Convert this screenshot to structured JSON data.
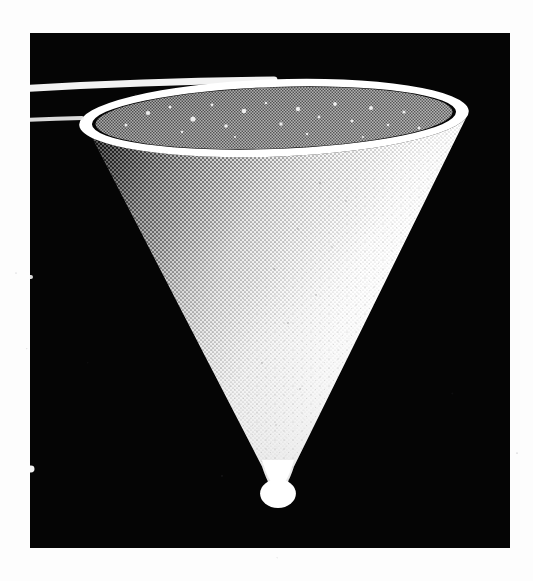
{
  "page": {
    "kind": "scanned-figure-page",
    "background_color": "#fdfdfd",
    "width": 533,
    "height": 581,
    "caption": "",
    "margin_note": ""
  },
  "figure_panel": {
    "name": "rendered-cone-figure",
    "background_color": "#050505",
    "x": 30,
    "y": 33,
    "width": 480,
    "height": 515,
    "border": "none"
  },
  "chart_data": {
    "type": "scatter",
    "title": "",
    "subtitle": "",
    "xlabel": "",
    "ylabel": "",
    "legend": [],
    "annotations": [],
    "grid": false,
    "render": {
      "subject": "cone",
      "orientation": "apex-down",
      "projection": "perspective",
      "shading": "diffuse-halftone-dither",
      "light_direction": "upper-right",
      "background": "#050505",
      "surface_color_lit": "#ffffff",
      "surface_color_shadow": "#1a1a1a",
      "interior_color": "#8c8c8c",
      "rim_highlight_color": "#ffffff"
    },
    "geometry": {
      "rim_ellipse": {
        "center_x": 274,
        "center_y": 118,
        "semi_major_x": 192,
        "semi_minor_y": 38,
        "tilt_degrees": -2.0
      },
      "apex": {
        "x": 278,
        "y": 508,
        "radius": 16
      },
      "left_rim_extreme": {
        "x": 82,
        "y": 117
      },
      "right_rim_extreme": {
        "x": 467,
        "y": 121
      },
      "height_px": 390,
      "opening_width_px": 385
    },
    "x": [
      82,
      467,
      278
    ],
    "y": [
      117,
      121,
      508
    ],
    "point_labels": [
      "rim-left",
      "rim-right",
      "apex"
    ]
  },
  "elements": {
    "cone_outer_surface_label": "cone lateral surface",
    "cone_inner_surface_label": "cone interior",
    "cone_rim_label": "cone rim highlight",
    "cone_apex_label": "cone apex"
  }
}
